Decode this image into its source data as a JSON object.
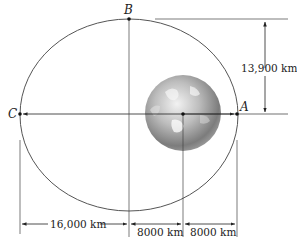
{
  "diagram": {
    "type": "orbit-ellipse",
    "points": {
      "A": "A",
      "B": "B",
      "C": "C"
    },
    "dimensions": {
      "vertical": "13,900 km",
      "bottom_left": "16,000 km",
      "bottom_middle": "8000 km",
      "bottom_right": "8000 km"
    },
    "colors": {
      "orbit": "#555555",
      "lines": "#333333",
      "earth_light": "#e8e8e8",
      "earth_dark": "#6a6a6a"
    }
  }
}
